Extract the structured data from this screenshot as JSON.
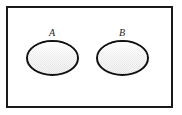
{
  "figure": {
    "name": "two-disjoint-sets-venn-diagram",
    "type": "venn-diagram"
  },
  "universe": {
    "shape": "rectangle",
    "border_color": "#1a1a1a",
    "fill_color": "#ffffff",
    "border_width": 2,
    "x": 6,
    "y": 6,
    "width": 167,
    "height": 102
  },
  "sets": [
    {
      "id": "set-a",
      "label": "A",
      "shape": "ellipse",
      "cx": 52.5,
      "cy": 58,
      "rx": 25.5,
      "ry": 17,
      "stroke_color": "#111111",
      "stroke_width": 2,
      "fill_color": "#ededed",
      "label_x": 52,
      "label_y": 36
    },
    {
      "id": "set-b",
      "label": "B",
      "shape": "ellipse",
      "cx": 122.5,
      "cy": 58,
      "rx": 25.5,
      "ry": 17,
      "stroke_color": "#111111",
      "stroke_width": 2,
      "fill_color": "#ededed",
      "label_x": 122,
      "label_y": 36
    }
  ],
  "colors": {
    "ink": "#1a1a1a",
    "ellipse_stroke": "#111111",
    "ellipse_fill": "#ededed",
    "background": "#ffffff",
    "page": "#ffffff"
  }
}
